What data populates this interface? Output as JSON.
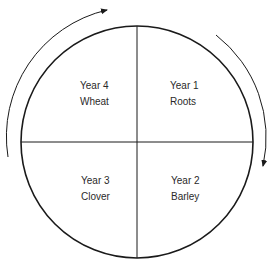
{
  "diagram": {
    "type": "crop-rotation-cycle",
    "direction": "clockwise",
    "colors": {
      "stroke": "#1a1a1a",
      "text": "#2a2a2a",
      "background": "#ffffff"
    },
    "quadrants": [
      {
        "position": "top-right",
        "year": "Year 1",
        "crop": "Roots"
      },
      {
        "position": "bottom-right",
        "year": "Year 2",
        "crop": "Barley"
      },
      {
        "position": "bottom-left",
        "year": "Year 3",
        "crop": "Clover"
      },
      {
        "position": "top-left",
        "year": "Year 4",
        "crop": "Wheat"
      }
    ],
    "arrows": [
      {
        "name": "left-arc-arrow",
        "direction": "upward-clockwise"
      },
      {
        "name": "right-arc-arrow",
        "direction": "downward-clockwise"
      }
    ]
  }
}
